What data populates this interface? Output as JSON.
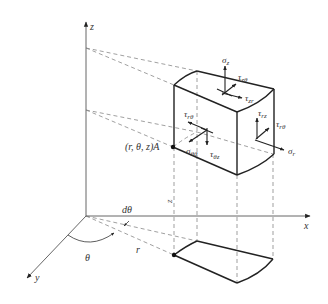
{
  "diagram": {
    "axes": {
      "x": "x",
      "y": "y",
      "z": "z"
    },
    "point_label": "(r, θ, z)A",
    "angle_label": "θ",
    "dtheta_label": "dθ",
    "radius_label": "r",
    "height_label": "z",
    "stresses": {
      "sigma_z": {
        "sym": "σ",
        "sub": "z"
      },
      "tau_ztheta": {
        "sym": "τ",
        "sub": "zθ"
      },
      "tau_zr": {
        "sym": "τ",
        "sub": "zr"
      },
      "tau_rz": {
        "sym": "τ",
        "sub": "rz"
      },
      "tau_rtheta_right": {
        "sym": "τ",
        "sub": "rθ"
      },
      "sigma_r": {
        "sym": "σ",
        "sub": "r"
      },
      "tau_rtheta_left": {
        "sym": "τ",
        "sub": "rθ"
      },
      "sigma_theta": {
        "sym": "σ",
        "sub": "θθ"
      },
      "tau_thetaz": {
        "sym": "τ",
        "sub": "θz"
      }
    },
    "colors": {
      "line": "#222222",
      "dashed": "#777777",
      "axis": "#555555"
    }
  }
}
